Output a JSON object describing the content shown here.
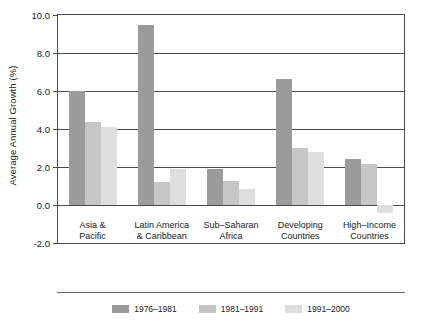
{
  "chart_data": {
    "type": "bar",
    "title": "",
    "subtitle": "",
    "xlabel": "",
    "ylabel": "Average Annual Growth (%)",
    "ylim": [
      -2.0,
      10.0
    ],
    "yticks": [
      "-2.0",
      "0.0",
      "2.0",
      "4.0",
      "6.0",
      "8.0",
      "10.0"
    ],
    "ytick_values": [
      -2.0,
      0.0,
      2.0,
      4.0,
      6.0,
      8.0,
      10.0
    ],
    "grid": true,
    "legend_position": "bottom",
    "categories": [
      "Asia &\nPacific",
      "Latin America\n& Caribbean",
      "Sub–Saharan\nAfrica",
      "Developing\nCountries",
      "High–Income\nCountries"
    ],
    "category_lines": [
      [
        "Asia &",
        "Pacific"
      ],
      [
        "Latin America",
        "& Caribbean"
      ],
      [
        "Sub–Saharan",
        "Africa"
      ],
      [
        "Developing",
        "Countries"
      ],
      [
        "High–Income",
        "Countries"
      ]
    ],
    "series": [
      {
        "name": "1976–1981",
        "color": "#9b9b9b",
        "values": [
          6.0,
          9.5,
          1.9,
          6.65,
          2.4
        ]
      },
      {
        "name": "1981–1991",
        "color": "#c6c6c6",
        "values": [
          4.35,
          1.2,
          1.25,
          3.0,
          2.15
        ]
      },
      {
        "name": "1991–2000",
        "color": "#dedede",
        "values": [
          4.1,
          1.9,
          0.85,
          2.8,
          -0.4
        ]
      }
    ]
  },
  "colors": {
    "series_1976_1981": "#9b9b9b",
    "series_1981_1991": "#c6c6c6",
    "series_1991_2000": "#dedede",
    "axis": "#4a4a4a",
    "text": "#222222",
    "background": "#ffffff"
  }
}
